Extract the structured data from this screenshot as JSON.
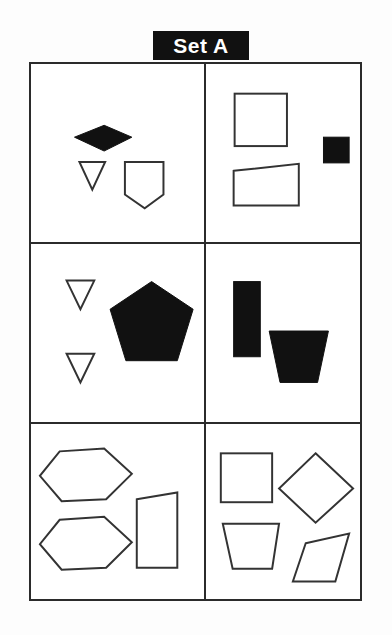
{
  "page": {
    "title": "Set A",
    "background_color": "#fdfdfd",
    "ink_color": "#2b2b2b",
    "fill_color": "#111111",
    "outline_fill_color": "#ffffff"
  },
  "banner": {
    "label": "Set A",
    "background_color": "#111111",
    "text_color": "#ffffff"
  },
  "grid": {
    "columns": 2,
    "rows": 3,
    "border_color": "#2b2b2b",
    "cells": [
      {
        "id": "cell-1",
        "position": "row-1-col-1",
        "shape_count": 3,
        "shapes": [
          {
            "name": "diamond",
            "style": "filled",
            "label": "black diamond"
          },
          {
            "name": "triangle-down",
            "style": "outline",
            "label": "white triangle pointing down"
          },
          {
            "name": "shield-pentagon",
            "style": "outline",
            "label": "white pentagon with pointed bottom"
          }
        ]
      },
      {
        "id": "cell-2",
        "position": "row-1-col-2",
        "shape_count": 3,
        "shapes": [
          {
            "name": "square",
            "style": "outline",
            "label": "white square"
          },
          {
            "name": "square-small",
            "style": "filled",
            "label": "small black square"
          },
          {
            "name": "quadrilateral",
            "style": "outline",
            "label": "white quadrilateral with slanted top"
          }
        ]
      },
      {
        "id": "cell-3",
        "position": "row-2-col-1",
        "shape_count": 3,
        "shapes": [
          {
            "name": "triangle-down-upper",
            "style": "outline",
            "label": "white triangle pointing down"
          },
          {
            "name": "triangle-down-lower",
            "style": "outline",
            "label": "white triangle pointing down"
          },
          {
            "name": "pentagon",
            "style": "filled",
            "label": "large black pentagon"
          }
        ]
      },
      {
        "id": "cell-4",
        "position": "row-2-col-2",
        "shape_count": 2,
        "shapes": [
          {
            "name": "rectangle-vertical",
            "style": "filled",
            "label": "black vertical rectangle"
          },
          {
            "name": "trapezoid",
            "style": "filled",
            "label": "black trapezoid"
          }
        ]
      },
      {
        "id": "cell-5",
        "position": "row-3-col-1",
        "shape_count": 3,
        "shapes": [
          {
            "name": "hexagon-upper",
            "style": "outline",
            "label": "white hexagon"
          },
          {
            "name": "hexagon-lower",
            "style": "outline",
            "label": "white hexagon"
          },
          {
            "name": "parallelogram",
            "style": "outline",
            "label": "white slanted rectangle"
          }
        ]
      },
      {
        "id": "cell-6",
        "position": "row-3-col-2",
        "shape_count": 4,
        "shapes": [
          {
            "name": "square",
            "style": "outline",
            "label": "white square"
          },
          {
            "name": "diamond",
            "style": "outline",
            "label": "white diamond"
          },
          {
            "name": "trapezoid",
            "style": "outline",
            "label": "white trapezoid"
          },
          {
            "name": "parallelogram",
            "style": "outline",
            "label": "white parallelogram"
          }
        ]
      }
    ]
  }
}
